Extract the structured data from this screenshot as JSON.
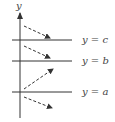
{
  "diagram": {
    "axis_label": "y",
    "lines": [
      {
        "label": "y = c",
        "y": 40
      },
      {
        "label": "y = b",
        "y": 61
      },
      {
        "label": "y = a",
        "y": 92
      }
    ],
    "arrows": [
      {
        "x1": 24,
        "y1": 26,
        "x2": 50,
        "y2": 38,
        "direction": "down-right"
      },
      {
        "x1": 24,
        "y1": 46,
        "x2": 50,
        "y2": 58,
        "direction": "down-right"
      },
      {
        "x1": 24,
        "y1": 89,
        "x2": 53,
        "y2": 69,
        "direction": "up-right"
      },
      {
        "x1": 24,
        "y1": 97,
        "x2": 52,
        "y2": 108,
        "direction": "down-right"
      }
    ],
    "colors": {
      "line": "#333333",
      "text": "#444444"
    }
  }
}
